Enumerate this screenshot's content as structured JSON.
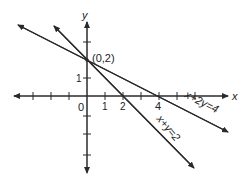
{
  "diagram": {
    "type": "coordinate-plane",
    "axes": {
      "x_label": "x",
      "y_label": "y",
      "origin_label": "0",
      "x_tick_labels": [
        {
          "value": 1,
          "label": "1"
        },
        {
          "value": 2,
          "label": "2"
        },
        {
          "value": 4,
          "label": "4"
        }
      ],
      "y_tick_labels": [
        {
          "value": 1,
          "label": "1"
        }
      ]
    },
    "point": {
      "label": "(0,2)",
      "x": 0,
      "y": 2
    },
    "lines": [
      {
        "equation": "x + 2y = 4",
        "label": "x+2y=4",
        "x_intercept": 4,
        "y_intercept": 2
      },
      {
        "equation": "x + y = 2",
        "label": "x+y=2",
        "x_intercept": 2,
        "y_intercept": 2
      }
    ],
    "colors": {
      "ink": "#2a2a2a",
      "background": "#ffffff"
    }
  }
}
